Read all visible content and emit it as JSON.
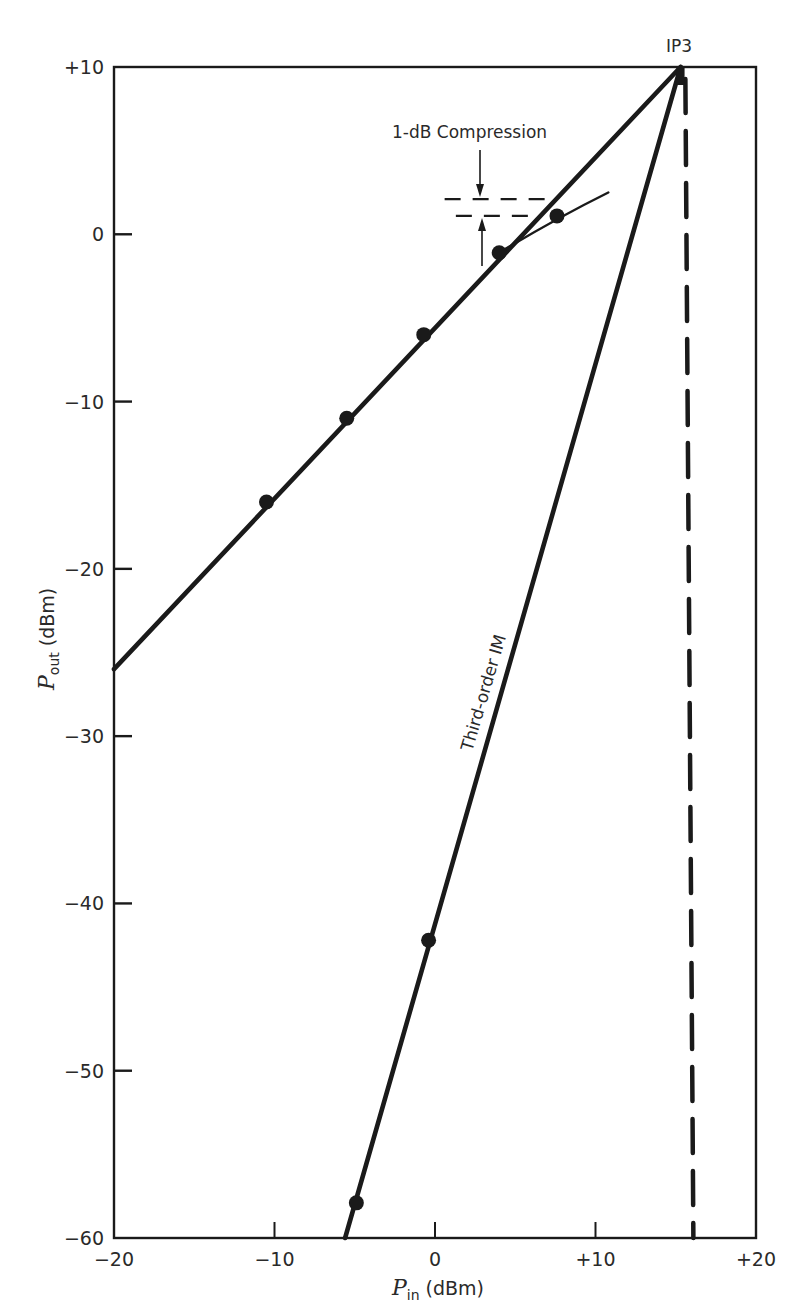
{
  "chart_data": {
    "type": "line",
    "title": "",
    "xlabel": {
      "symbol": "P",
      "subscript": "in",
      "unit": "(dBm)"
    },
    "ylabel": {
      "symbol": "P",
      "subscript": "out",
      "unit": "(dBm)"
    },
    "xlim": [
      -20,
      20
    ],
    "ylim": [
      -60,
      10
    ],
    "grid": false,
    "legend": "none",
    "x_ticks": [
      {
        "value": -20,
        "label": "−20"
      },
      {
        "value": -10,
        "label": "−10"
      },
      {
        "value": 0,
        "label": "0"
      },
      {
        "value": 10,
        "label": "+10"
      },
      {
        "value": 20,
        "label": "+20"
      }
    ],
    "y_ticks": [
      {
        "value": 10,
        "label": "+10"
      },
      {
        "value": 0,
        "label": "0"
      },
      {
        "value": -10,
        "label": "−10"
      },
      {
        "value": -20,
        "label": "−20"
      },
      {
        "value": -30,
        "label": "−30"
      },
      {
        "value": -40,
        "label": "−40"
      },
      {
        "value": -50,
        "label": "−50"
      },
      {
        "value": -60,
        "label": "−60"
      }
    ],
    "series": [
      {
        "name": "Fundamental (linear extrapolation)",
        "style": "solid-thick",
        "line": [
          [
            -20,
            -26
          ],
          [
            15.3,
            10
          ]
        ],
        "points": [
          [
            -10.5,
            -16
          ],
          [
            -5.5,
            -11
          ],
          [
            -0.7,
            -6
          ],
          [
            4,
            -1.1
          ]
        ]
      },
      {
        "name": "Fundamental (compressed)",
        "style": "solid-thin",
        "line": [
          [
            4,
            -1.1
          ],
          [
            7.6,
            1.1
          ],
          [
            10.8,
            2.5
          ]
        ],
        "points": [
          [
            7.6,
            1.1
          ]
        ]
      },
      {
        "name": "Third-order IM",
        "style": "solid-thick",
        "line": [
          [
            -5.6,
            -60
          ],
          [
            15.3,
            10
          ]
        ],
        "points": [
          [
            -0.4,
            -42.2
          ],
          [
            -4.9,
            -57.9
          ]
        ]
      }
    ],
    "reference_lines": [
      {
        "name": "IP3 input level",
        "orientation": "vertical",
        "x": 15.6,
        "style": "dashed"
      },
      {
        "name": "compression-upper",
        "orientation": "horizontal",
        "y": 2.1,
        "x_range": [
          0.6,
          7
        ],
        "style": "dashed"
      },
      {
        "name": "compression-lower",
        "orientation": "horizontal",
        "y": 1.1,
        "x_range": [
          1.3,
          6.3
        ],
        "style": "dashed"
      }
    ],
    "annotations": [
      {
        "name": "ip3-label",
        "text": "IP3",
        "x": 15.3,
        "y": 10
      },
      {
        "name": "compression-label",
        "text": "1-dB Compression",
        "x": 4.2,
        "y": 6.2
      },
      {
        "name": "im3-label",
        "text": "Third-order IM",
        "x": 0.7,
        "y": -26
      }
    ],
    "ip3": {
      "x": 15.3,
      "y": 10
    }
  }
}
